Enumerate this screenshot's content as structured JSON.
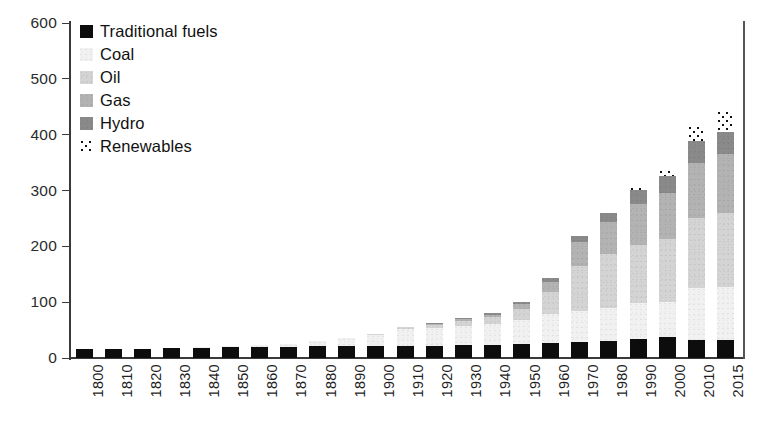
{
  "chart_data": {
    "type": "bar",
    "stacked": true,
    "title": "",
    "subtitle": "",
    "xlabel": "",
    "ylabel": "",
    "ylim": [
      0,
      600
    ],
    "ytick_values": [
      0,
      100,
      200,
      300,
      400,
      500,
      600
    ],
    "ytick_labels": [
      "0",
      "100",
      "200",
      "300",
      "400",
      "500",
      "600"
    ],
    "grid": false,
    "legend_position": "top-left",
    "categories": [
      "1800",
      "1810",
      "1820",
      "1830",
      "1840",
      "1850",
      "1860",
      "1870",
      "1880",
      "1890",
      "1900",
      "1910",
      "1920",
      "1930",
      "1940",
      "1950",
      "1960",
      "1970",
      "1980",
      "1990",
      "2000",
      "2010",
      "2015"
    ],
    "series": [
      {
        "name": "Traditional fuels",
        "color": "#0d0d0d",
        "values": [
          17,
          17,
          17,
          18,
          19,
          20,
          20,
          20,
          21,
          22,
          22,
          22,
          22,
          23,
          24,
          25,
          26,
          28,
          30,
          34,
          38,
          33,
          32
        ]
      },
      {
        "name": "Coal",
        "color": "#f1f1f1",
        "values": [
          0,
          0,
          0,
          0,
          1,
          2,
          3,
          6,
          10,
          14,
          20,
          30,
          32,
          34,
          37,
          43,
          53,
          57,
          60,
          65,
          63,
          92,
          95
        ]
      },
      {
        "name": "Oil",
        "color": "#d4d4d4",
        "values": [
          0,
          0,
          0,
          0,
          0,
          0,
          0,
          0,
          0,
          0,
          1,
          4,
          6,
          10,
          13,
          20,
          40,
          80,
          96,
          104,
          113,
          126,
          132
        ]
      },
      {
        "name": "Gas",
        "color": "#b3b3b3",
        "values": [
          0,
          0,
          0,
          0,
          0,
          0,
          0,
          0,
          0,
          0,
          0,
          0,
          1,
          2,
          3,
          8,
          17,
          42,
          57,
          72,
          82,
          99,
          106
        ]
      },
      {
        "name": "Hydro",
        "color": "#8a8a8a",
        "values": [
          0,
          0,
          0,
          0,
          0,
          0,
          0,
          0,
          0,
          0,
          0,
          0,
          1,
          2,
          3,
          4,
          7,
          12,
          17,
          26,
          30,
          38,
          40
        ]
      },
      {
        "name": "Renewables",
        "color": "#ffffff",
        "pattern": "dotted",
        "values": [
          0,
          0,
          0,
          0,
          0,
          0,
          0,
          0,
          0,
          0,
          0,
          0,
          0,
          0,
          0,
          0,
          0,
          0,
          0,
          5,
          11,
          28,
          37
        ]
      }
    ],
    "totals": [
      17,
      17,
      17,
      18,
      20,
      22,
      23,
      26,
      31,
      36,
      43,
      56,
      62,
      71,
      80,
      100,
      143,
      219,
      280,
      306,
      337,
      416,
      442
    ],
    "legend": [
      "Traditional fuels",
      "Coal",
      "Oil",
      "Gas",
      "Hydro",
      "Renewables"
    ]
  },
  "legend": {
    "items": [
      {
        "label": "Traditional fuels",
        "swatch": "legend-swatch-traditional"
      },
      {
        "label": "Coal",
        "swatch": "legend-swatch-coal"
      },
      {
        "label": "Oil",
        "swatch": "legend-swatch-oil"
      },
      {
        "label": "Gas",
        "swatch": "legend-swatch-gas"
      },
      {
        "label": "Hydro",
        "swatch": "legend-swatch-hydro"
      },
      {
        "label": "Renewables",
        "swatch": "legend-swatch-renewables"
      }
    ]
  },
  "colors": {
    "traditional": "#0d0d0d",
    "coal": "#f1f1f1",
    "oil": "#d4d4d4",
    "gas": "#b3b3b3",
    "hydro": "#8a8a8a",
    "renewables": "#ffffff",
    "axis": "#3a3a3a",
    "background": "#ffffff"
  }
}
